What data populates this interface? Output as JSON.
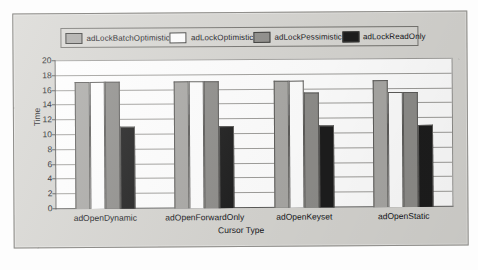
{
  "chart_data": {
    "type": "bar",
    "title": "",
    "xlabel": "Cursor Type",
    "ylabel": "Time",
    "ylim": [
      0,
      20
    ],
    "ytick_step": 2,
    "yticks": [
      20,
      18,
      16,
      14,
      12,
      10,
      8,
      6,
      4,
      2,
      0
    ],
    "grid": true,
    "legend_position": "top",
    "categories": [
      "adOpenDynamic",
      "adOpenForwardOnly",
      "adOpenKeyset",
      "adOpenStatic"
    ],
    "series": [
      {
        "name": "adLockBatchOptimistic",
        "color": "#a9a8a5",
        "values": [
          17,
          17,
          17,
          17
        ]
      },
      {
        "name": "adLockOptimistic",
        "color": "#ffffff",
        "values": [
          17,
          17,
          17,
          15.5
        ]
      },
      {
        "name": "adLockPessimistic",
        "color": "#8e8d8a",
        "values": [
          17,
          17,
          15.5,
          15.5
        ]
      },
      {
        "name": "adLockReadOnly",
        "color": "#1d1d1d",
        "values": [
          11,
          11,
          11,
          11
        ]
      }
    ]
  },
  "colors": {
    "panel_bg": "#d6d5d1",
    "panel_border": "#8e8d8a",
    "plot_bg": "#ffffff",
    "axis": "#5a5a58",
    "grid": "#9e9d9a",
    "text": "#15151a"
  }
}
